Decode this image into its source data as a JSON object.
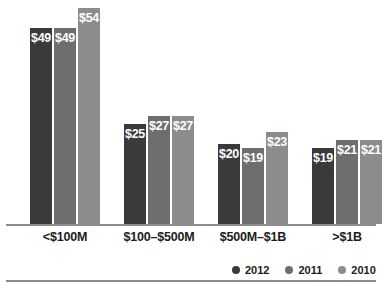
{
  "chart_data": {
    "type": "bar",
    "title": "",
    "subtitle": "",
    "xlabel": "",
    "ylabel": "",
    "grid": false,
    "legend_position": "bottom-right",
    "ylim": [
      0,
      56
    ],
    "value_prefix": "$",
    "categories": [
      "<$100M",
      "$100–$500M",
      "$500M–$1B",
      ">$1B"
    ],
    "series": [
      {
        "name": "2012",
        "color": "#3a3a3a",
        "values": [
          49,
          25,
          20,
          19
        ],
        "labels": [
          "$49",
          "$25",
          "$20",
          "$19"
        ]
      },
      {
        "name": "2011",
        "color": "#6e6e6e",
        "values": [
          49,
          27,
          19,
          21
        ],
        "labels": [
          "$49",
          "$27",
          "$19",
          "$21"
        ]
      },
      {
        "name": "2010",
        "color": "#8c8c8c",
        "values": [
          54,
          27,
          23,
          21
        ],
        "labels": [
          "$54",
          "$27",
          "$23",
          "$21"
        ]
      }
    ]
  },
  "axis": {
    "baseline_color": "#8b8b8b"
  },
  "footer": {
    "rule_color": "#8b8b8b"
  }
}
